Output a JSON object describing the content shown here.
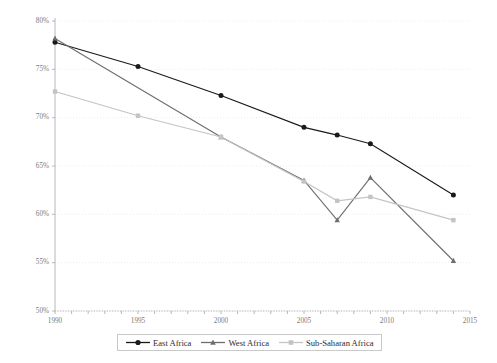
{
  "chart_data": {
    "type": "line",
    "title": "",
    "xlabel": "",
    "ylabel": "Urban population living in slums",
    "xlim": [
      1990,
      2015
    ],
    "ylim": [
      50,
      80
    ],
    "grid": true,
    "legend_position": "bottom",
    "x_ticks": [
      "1990",
      "1995",
      "2000",
      "2005",
      "2010",
      "2015"
    ],
    "x_tick_values": [
      1990,
      1995,
      2000,
      2005,
      2010,
      2015
    ],
    "y_ticks": [
      "50%",
      "55%",
      "60%",
      "65%",
      "70%",
      "75%",
      "80%"
    ],
    "y_tick_values": [
      50,
      55,
      60,
      65,
      70,
      75,
      80
    ],
    "series": [
      {
        "name": "East Africa",
        "color": "#1a1a1a",
        "marker": "circle",
        "x": [
          1990,
          1995,
          2000,
          2005,
          2007,
          2009,
          2014
        ],
        "values": [
          77.8,
          75.3,
          72.3,
          69.0,
          68.2,
          67.3,
          62.0
        ]
      },
      {
        "name": "West Africa",
        "color": "#6e6e6e",
        "marker": "triangle",
        "x": [
          1990,
          2000,
          2005,
          2007,
          2009,
          2014
        ],
        "values": [
          78.2,
          68.0,
          63.5,
          59.4,
          63.8,
          55.2
        ]
      },
      {
        "name": "Sub-Saharan Africa",
        "color": "#c4c4c4",
        "marker": "square",
        "x": [
          1990,
          1995,
          2000,
          2005,
          2007,
          2009,
          2014
        ],
        "values": [
          72.7,
          70.2,
          68.0,
          63.4,
          61.4,
          61.8,
          59.4
        ]
      }
    ]
  },
  "legend": {
    "items": [
      {
        "label": "East Africa"
      },
      {
        "label": "West Africa"
      },
      {
        "label": "Sub-Saharan Africa"
      }
    ]
  },
  "colors": {
    "east_africa": "#1a1a1a",
    "west_africa": "#6e6e6e",
    "sub_saharan_africa": "#c4c4c4",
    "gridline": "#ededed",
    "axis": "#b8b8b8"
  }
}
